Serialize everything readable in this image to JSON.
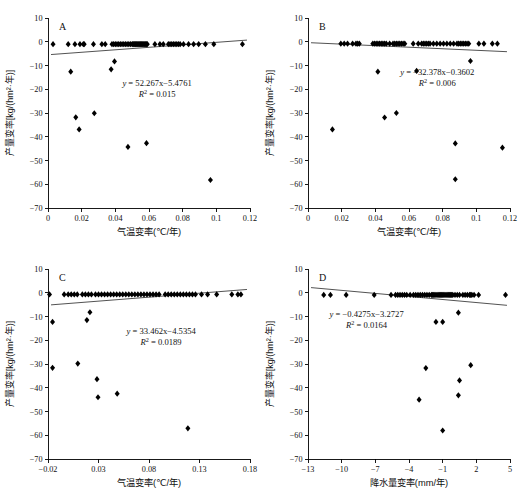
{
  "figure": {
    "panel_count": 4,
    "marker_color": "#000000",
    "line_color": "#333333"
  },
  "chart_data": [
    {
      "type": "scatter",
      "panel": "A",
      "title": "",
      "xlabel": "气温变率(℃/年)",
      "ylabel": "产量变率[kg/(hm²·年)]",
      "xlim": [
        0,
        0.12
      ],
      "ylim": [
        -70,
        10
      ],
      "xticks": [
        "0",
        "0.02",
        "0.04",
        "0.06",
        "0.08",
        "0.1",
        "0.12"
      ],
      "yticks": [
        "10",
        "0",
        "-10",
        "-20",
        "-30",
        "-40",
        "-50",
        "-60",
        "-70"
      ],
      "grid": false,
      "legend": "none",
      "annotation_equation": "y = 52.267x−5.4761",
      "annotation_r2": "R² = 0.015",
      "fit": {
        "slope": 52.267,
        "intercept": -5.4761,
        "r2": 0.015
      },
      "points": [
        [
          0.003,
          -1.0
        ],
        [
          0.012,
          -1.0
        ],
        [
          0.016,
          -1.0
        ],
        [
          0.019,
          -1.0
        ],
        [
          0.021,
          -1.0
        ],
        [
          0.0215,
          -1.0
        ],
        [
          0.027,
          -1.0
        ],
        [
          0.032,
          -1.0
        ],
        [
          0.034,
          -1.0
        ],
        [
          0.038,
          -1.0
        ],
        [
          0.039,
          -1.0
        ],
        [
          0.04,
          -1.0
        ],
        [
          0.041,
          -1.0
        ],
        [
          0.042,
          -1.0
        ],
        [
          0.043,
          -1.0
        ],
        [
          0.044,
          -1.0
        ],
        [
          0.045,
          -1.0
        ],
        [
          0.046,
          -1.0
        ],
        [
          0.047,
          -1.0
        ],
        [
          0.048,
          -1.0
        ],
        [
          0.049,
          -1.0
        ],
        [
          0.05,
          -1.0
        ],
        [
          0.0505,
          -1.0
        ],
        [
          0.051,
          -1.0
        ],
        [
          0.0515,
          -1.0
        ],
        [
          0.052,
          -1.0
        ],
        [
          0.0525,
          -1.0
        ],
        [
          0.053,
          -1.0
        ],
        [
          0.0535,
          -1.0
        ],
        [
          0.054,
          -1.0
        ],
        [
          0.0545,
          -1.0
        ],
        [
          0.055,
          -1.0
        ],
        [
          0.0555,
          -1.0
        ],
        [
          0.056,
          -1.0
        ],
        [
          0.0565,
          -1.0
        ],
        [
          0.057,
          -1.0
        ],
        [
          0.0575,
          -1.0
        ],
        [
          0.058,
          -1.0
        ],
        [
          0.0585,
          -1.0
        ],
        [
          0.059,
          -1.0
        ],
        [
          0.0635,
          -1.0
        ],
        [
          0.0665,
          -1.0
        ],
        [
          0.0685,
          -1.0
        ],
        [
          0.0715,
          -1.0
        ],
        [
          0.0725,
          -1.0
        ],
        [
          0.0735,
          -1.0
        ],
        [
          0.0745,
          -1.0
        ],
        [
          0.0755,
          -1.0
        ],
        [
          0.0765,
          -1.0
        ],
        [
          0.0775,
          -1.0
        ],
        [
          0.0785,
          -1.0
        ],
        [
          0.0805,
          -1.0
        ],
        [
          0.0835,
          -1.0
        ],
        [
          0.0865,
          -1.0
        ],
        [
          0.0895,
          -1.0
        ],
        [
          0.0935,
          -1.0
        ],
        [
          0.0985,
          -1.0
        ],
        [
          0.1155,
          -1.0
        ],
        [
          0.0135,
          -12.6
        ],
        [
          0.0375,
          -11.6
        ],
        [
          0.0395,
          -8.3
        ],
        [
          0.0165,
          -31.8
        ],
        [
          0.0185,
          -36.9
        ],
        [
          0.0275,
          -30.1
        ],
        [
          0.0475,
          -44.3
        ],
        [
          0.0585,
          -42.7
        ],
        [
          0.0965,
          -58.2
        ]
      ]
    },
    {
      "type": "scatter",
      "panel": "B",
      "title": "",
      "xlabel": "气温变率(℃/年)",
      "ylabel": "产量变率[kg/(hm²·年)]",
      "xlim": [
        0,
        0.12
      ],
      "ylim": [
        -70,
        10
      ],
      "xticks": [
        "0",
        "0.02",
        "0.04",
        "0.06",
        "0.08",
        "0.1",
        "0.12"
      ],
      "yticks": [
        "10",
        "0",
        "-10",
        "-20",
        "-30",
        "-40",
        "-50",
        "-60",
        "-70"
      ],
      "grid": false,
      "legend": "none",
      "annotation_equation": "y = −32.378x−0.3602",
      "annotation_r2": "R² = 0.006",
      "fit": {
        "slope": -32.378,
        "intercept": -0.3602,
        "r2": 0.006
      },
      "points": [
        [
          0.0195,
          -0.8
        ],
        [
          0.0215,
          -0.8
        ],
        [
          0.0235,
          -0.8
        ],
        [
          0.0265,
          -0.8
        ],
        [
          0.0285,
          -0.8
        ],
        [
          0.0295,
          -0.8
        ],
        [
          0.0305,
          -0.8
        ],
        [
          0.0385,
          -0.8
        ],
        [
          0.0395,
          -0.8
        ],
        [
          0.0405,
          -0.8
        ],
        [
          0.0415,
          -0.8
        ],
        [
          0.0425,
          -0.8
        ],
        [
          0.0435,
          -0.8
        ],
        [
          0.0445,
          -0.8
        ],
        [
          0.0455,
          -0.8
        ],
        [
          0.0465,
          -0.8
        ],
        [
          0.0485,
          -0.8
        ],
        [
          0.0505,
          -0.8
        ],
        [
          0.0515,
          -0.8
        ],
        [
          0.0525,
          -0.8
        ],
        [
          0.0535,
          -0.8
        ],
        [
          0.0545,
          -0.8
        ],
        [
          0.0555,
          -0.8
        ],
        [
          0.0565,
          -0.8
        ],
        [
          0.0575,
          -0.8
        ],
        [
          0.0625,
          -0.8
        ],
        [
          0.0655,
          -0.8
        ],
        [
          0.0675,
          -0.8
        ],
        [
          0.0685,
          -0.8
        ],
        [
          0.0695,
          -0.8
        ],
        [
          0.0705,
          -0.8
        ],
        [
          0.0715,
          -0.8
        ],
        [
          0.0725,
          -0.8
        ],
        [
          0.0745,
          -0.8
        ],
        [
          0.0765,
          -0.8
        ],
        [
          0.0785,
          -0.8
        ],
        [
          0.0805,
          -0.8
        ],
        [
          0.0825,
          -0.8
        ],
        [
          0.0845,
          -0.8
        ],
        [
          0.0865,
          -0.8
        ],
        [
          0.0885,
          -0.8
        ],
        [
          0.0895,
          -0.8
        ],
        [
          0.0905,
          -0.8
        ],
        [
          0.0915,
          -0.8
        ],
        [
          0.0925,
          -0.8
        ],
        [
          0.0935,
          -0.8
        ],
        [
          0.0945,
          -0.8
        ],
        [
          0.0955,
          -0.8
        ],
        [
          0.1015,
          -0.8
        ],
        [
          0.1045,
          -0.8
        ],
        [
          0.1095,
          -0.8
        ],
        [
          0.1125,
          -0.8
        ],
        [
          0.0965,
          -8.1
        ],
        [
          0.0415,
          -12.6
        ],
        [
          0.0645,
          -12.3
        ],
        [
          0.0145,
          -36.9
        ],
        [
          0.0455,
          -31.9
        ],
        [
          0.0525,
          -30.0
        ],
        [
          0.0875,
          -42.8
        ],
        [
          0.1155,
          -44.6
        ],
        [
          0.0875,
          -57.9
        ]
      ]
    },
    {
      "type": "scatter",
      "panel": "C",
      "title": "",
      "xlabel": "气温变率(℃/年)",
      "ylabel": "产量变率[kg/(hm²·年)]",
      "xlim": [
        -0.02,
        0.18
      ],
      "ylim": [
        -70,
        10
      ],
      "xticks": [
        "-0.02",
        "0.03",
        "0.08",
        "0.13",
        "0.18"
      ],
      "yticks": [
        "10",
        "0",
        "-10",
        "-20",
        "-30",
        "-40",
        "-50",
        "-60",
        "-70"
      ],
      "grid": false,
      "legend": "none",
      "annotation_equation": "y = 33.462x−4.5354",
      "annotation_r2": "R² = 0.0189",
      "fit": {
        "slope": 33.462,
        "intercept": -4.5354,
        "r2": 0.0189
      },
      "points": [
        [
          -0.0185,
          -0.7
        ],
        [
          -0.004,
          -0.7
        ],
        [
          0.0,
          -0.7
        ],
        [
          0.003,
          -0.7
        ],
        [
          0.006,
          -0.7
        ],
        [
          0.009,
          -0.7
        ],
        [
          0.014,
          -0.7
        ],
        [
          0.017,
          -0.7
        ],
        [
          0.02,
          -0.7
        ],
        [
          0.023,
          -0.7
        ],
        [
          0.027,
          -0.7
        ],
        [
          0.03,
          -0.7
        ],
        [
          0.033,
          -0.7
        ],
        [
          0.036,
          -0.7
        ],
        [
          0.039,
          -0.7
        ],
        [
          0.042,
          -0.7
        ],
        [
          0.045,
          -0.7
        ],
        [
          0.048,
          -0.7
        ],
        [
          0.051,
          -0.7
        ],
        [
          0.054,
          -0.7
        ],
        [
          0.057,
          -0.7
        ],
        [
          0.06,
          -0.7
        ],
        [
          0.063,
          -0.7
        ],
        [
          0.066,
          -0.7
        ],
        [
          0.069,
          -0.7
        ],
        [
          0.072,
          -0.7
        ],
        [
          0.075,
          -0.7
        ],
        [
          0.078,
          -0.7
        ],
        [
          0.081,
          -0.7
        ],
        [
          0.084,
          -0.7
        ],
        [
          0.087,
          -0.7
        ],
        [
          0.09,
          -0.7
        ],
        [
          0.096,
          -0.7
        ],
        [
          0.099,
          -0.7
        ],
        [
          0.102,
          -0.7
        ],
        [
          0.105,
          -0.7
        ],
        [
          0.108,
          -0.7
        ],
        [
          0.111,
          -0.7
        ],
        [
          0.114,
          -0.7
        ],
        [
          0.117,
          -0.7
        ],
        [
          0.12,
          -0.7
        ],
        [
          0.123,
          -0.7
        ],
        [
          0.126,
          -0.7
        ],
        [
          0.132,
          -0.7
        ],
        [
          0.138,
          -0.7
        ],
        [
          0.147,
          -0.7
        ],
        [
          0.162,
          -0.7
        ],
        [
          0.168,
          -0.7
        ],
        [
          0.171,
          -0.7
        ],
        [
          -0.0155,
          -12.3
        ],
        [
          0.0215,
          -8.2
        ],
        [
          0.0185,
          -11.5
        ],
        [
          -0.0155,
          -31.6
        ],
        [
          0.0095,
          -29.8
        ],
        [
          0.0285,
          -36.4
        ],
        [
          0.0295,
          -44.0
        ],
        [
          0.0485,
          -42.5
        ],
        [
          0.1185,
          -57.1
        ]
      ]
    },
    {
      "type": "scatter",
      "panel": "D",
      "title": "",
      "xlabel": "降水量变率(mm/年)",
      "ylabel": "产量变率[kg/(hm²·年)]",
      "xlim": [
        -13,
        5
      ],
      "ylim": [
        -70,
        10
      ],
      "xticks": [
        "-13",
        "-10",
        "-7",
        "-4",
        "-1",
        "2",
        "5"
      ],
      "yticks": [
        "10",
        "0",
        "-10",
        "-20",
        "-30",
        "-40",
        "-50",
        "-60",
        "-70"
      ],
      "grid": false,
      "legend": "none",
      "annotation_equation": "y = −0.4275x−3.2727",
      "annotation_r2": "R² = 0.0164",
      "fit": {
        "slope": -0.4275,
        "intercept": -3.2727,
        "r2": 0.0164
      },
      "points": [
        [
          -11.6,
          -0.9
        ],
        [
          -11.0,
          -0.9
        ],
        [
          -9.6,
          -0.9
        ],
        [
          -7.1,
          -0.9
        ],
        [
          -5.6,
          -0.9
        ],
        [
          -5.2,
          -0.9
        ],
        [
          -5.0,
          -0.9
        ],
        [
          -4.8,
          -0.9
        ],
        [
          -4.6,
          -0.9
        ],
        [
          -4.4,
          -0.9
        ],
        [
          -4.2,
          -0.9
        ],
        [
          -3.9,
          -0.9
        ],
        [
          -3.6,
          -0.9
        ],
        [
          -3.4,
          -0.9
        ],
        [
          -3.2,
          -0.9
        ],
        [
          -3.0,
          -0.9
        ],
        [
          -2.8,
          -0.9
        ],
        [
          -2.6,
          -0.9
        ],
        [
          -2.4,
          -0.9
        ],
        [
          -2.2,
          -0.9
        ],
        [
          -2.0,
          -0.9
        ],
        [
          -1.9,
          -0.9
        ],
        [
          -1.8,
          -0.9
        ],
        [
          -1.7,
          -0.9
        ],
        [
          -1.6,
          -0.9
        ],
        [
          -1.5,
          -0.9
        ],
        [
          -1.4,
          -0.9
        ],
        [
          -1.3,
          -0.9
        ],
        [
          -1.2,
          -0.9
        ],
        [
          -1.1,
          -0.9
        ],
        [
          -1.0,
          -0.9
        ],
        [
          -0.9,
          -0.9
        ],
        [
          -0.8,
          -0.9
        ],
        [
          -0.7,
          -0.9
        ],
        [
          -0.6,
          -0.9
        ],
        [
          -0.5,
          -0.9
        ],
        [
          -0.4,
          -0.9
        ],
        [
          -0.3,
          -0.9
        ],
        [
          -0.2,
          -0.9
        ],
        [
          -0.1,
          -0.9
        ],
        [
          0.1,
          -0.9
        ],
        [
          0.3,
          -0.9
        ],
        [
          0.5,
          -0.9
        ],
        [
          0.8,
          -0.9
        ],
        [
          1.0,
          -0.9
        ],
        [
          1.2,
          -0.9
        ],
        [
          1.4,
          -0.9
        ],
        [
          1.5,
          -0.9
        ],
        [
          1.6,
          -0.9
        ],
        [
          1.8,
          -0.9
        ],
        [
          2.2,
          -0.9
        ],
        [
          4.6,
          -0.9
        ],
        [
          0.4,
          -8.4
        ],
        [
          -1.6,
          -12.3
        ],
        [
          -1.0,
          -12.3
        ],
        [
          -2.5,
          -31.7
        ],
        [
          1.5,
          -30.5
        ],
        [
          0.5,
          -36.9
        ],
        [
          -3.1,
          -45.0
        ],
        [
          0.4,
          -43.2
        ],
        [
          -1.0,
          -58.0
        ]
      ]
    }
  ]
}
